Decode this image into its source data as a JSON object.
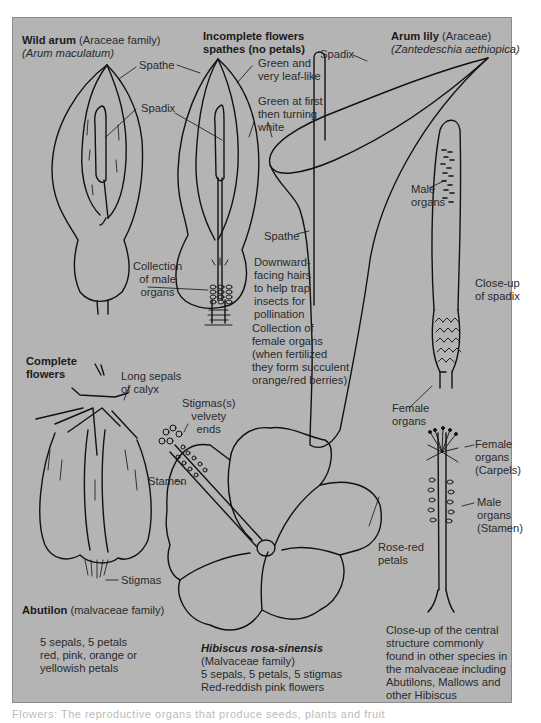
{
  "colors": {
    "panel_background": "#b4b4b4",
    "line_art": "#111111",
    "text": "#2a2a2a"
  },
  "wild_arum": {
    "title": "Wild arum",
    "family": " (Araceae family)",
    "species": "(Arum maculatum)",
    "labels": {
      "spathe": "Spathe",
      "spadix": "Spadix",
      "male_organs": "Collection\nof male\norgans"
    }
  },
  "incomplete_flowers": {
    "heading_line1": "Incomplete flowers",
    "heading_line2": "spathes (no petals)",
    "labels": {
      "green_leaf_like": "Green and\nvery leaf-like",
      "green_turning_white": "Green at first\nthen turning\nwhite",
      "spathe": "Spathe",
      "downward_hairs": "Downward-\nfacing hairs\nto help trap\ninsects for\npollination",
      "female_organs": "Collection of\nfemale organs\n(when fertilized\nthey form succulent\norange/red berries)"
    }
  },
  "arum_lily": {
    "title": "Arum lily",
    "family": " (Araceae)",
    "species": "(Zantedeschia aethiopica)",
    "labels": {
      "spadix": "Spadix",
      "male_organs": "Male\norgans",
      "closeup_spadix": "Close-up\nof spadix",
      "female_organs": "Female\norgans"
    }
  },
  "complete_flowers": {
    "heading": "Complete\nflowers"
  },
  "abutilon": {
    "title": "Abutilon",
    "family": " (malvaceae family)",
    "labels": {
      "long_sepals": "Long sepals\nof calyx",
      "stigmas": "Stigmas"
    },
    "description": "5 sepals, 5 petals\nred, pink, orange or\nyellowish petals"
  },
  "hibiscus": {
    "title": "Hibiscus rosa-sinensis",
    "family": "(Malvaceae family)",
    "description": "5 sepals, 5 petals, 5 stigmas\nRed-reddish pink flowers",
    "labels": {
      "stigmas_velvety": "Stigmas(s)\nvelvety\nends",
      "stamen": "Stamen",
      "rose_red_petals": "Rose-red\npetals"
    }
  },
  "central_structure": {
    "labels": {
      "female_carpels": "Female\norgans\n(Carpels)",
      "male_stamen": "Male\norgans\n(Stamen)"
    },
    "description": "Close-up of the central\nstructure commonly\nfound in other species in\nthe malvaceae including\nAbutilons, Mallows and\nother Hibiscus"
  },
  "caption": "Flowers: The reproductive organs that produce seeds, plants and fruit"
}
